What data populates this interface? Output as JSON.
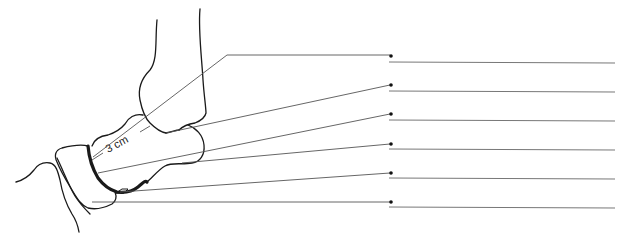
{
  "diagram": {
    "measurement_label": "3 cm",
    "colors": {
      "outline": "#1a1a1a",
      "leader": "#555555",
      "answer_line": "#777777",
      "background": "#ffffff"
    },
    "labels": [
      {
        "index": 1,
        "text": ""
      },
      {
        "index": 2,
        "text": ""
      },
      {
        "index": 3,
        "text": ""
      },
      {
        "index": 4,
        "text": ""
      },
      {
        "index": 5,
        "text": ""
      },
      {
        "index": 6,
        "text": ""
      }
    ]
  }
}
